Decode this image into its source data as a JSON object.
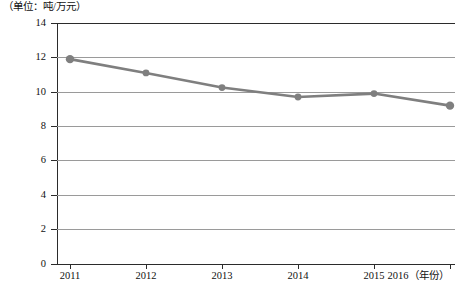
{
  "chart_data": {
    "type": "line",
    "title": "（单位：吨/万元）",
    "xlabel": "（年份）",
    "ylabel": "",
    "categories": [
      "2011",
      "2012",
      "2013",
      "2014",
      "2015",
      "2016"
    ],
    "values": [
      11.9,
      11.1,
      10.25,
      9.7,
      9.9,
      9.2
    ],
    "series": [
      {
        "name": "单位能耗",
        "values": [
          11.9,
          11.1,
          10.25,
          9.7,
          9.9,
          9.2
        ]
      }
    ],
    "ylim": [
      0,
      14
    ],
    "yticks": [
      0,
      2,
      4,
      6,
      8,
      10,
      12,
      14
    ],
    "ytick_labels": [
      "0",
      "2",
      "4",
      "6",
      "8",
      "10",
      "12",
      "14"
    ],
    "xtick_labels": [
      "2011",
      "2012",
      "2013",
      "2014",
      "2015",
      "2016"
    ],
    "grid": true,
    "legend": false,
    "legend_position": "none",
    "series_color": "#7f7f7f",
    "marker_color": "#7f7f7f",
    "gridline_color": "#9a9a9a",
    "axis_color": "#2b2b2b"
  },
  "axis": {
    "x_unit_label": "（年份）",
    "y_unit_title": "（单位：吨/万元）"
  }
}
